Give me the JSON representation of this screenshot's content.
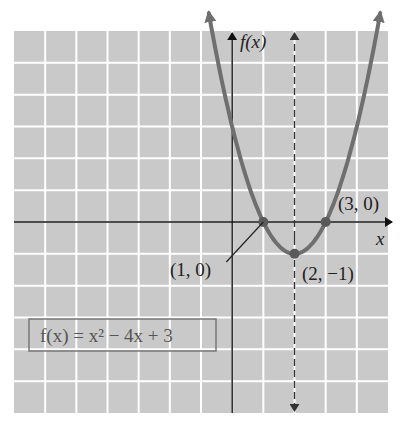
{
  "chart_data": {
    "type": "line",
    "title": "",
    "function_label": "f(x) = x² − 4x + 3",
    "function": {
      "a": 1,
      "b": -4,
      "c": 3
    },
    "xlabel": "x",
    "ylabel": "f(x)",
    "xlim": [
      -7,
      5
    ],
    "ylim": [
      -6,
      6
    ],
    "grid": true,
    "grid_step": 1,
    "axis_of_symmetry": {
      "x": 2,
      "style": "dashed"
    },
    "points": [
      {
        "x": 1,
        "y": 0,
        "label": "(1, 0)"
      },
      {
        "x": 3,
        "y": 0,
        "label": "(3, 0)"
      },
      {
        "x": 2,
        "y": -1,
        "label": "(2, −1)"
      }
    ],
    "curve_range": [
      -0.75,
      4.75
    ],
    "colors": {
      "grid_background": "#c9c9c9",
      "grid_lines": "#ffffff",
      "curve": "#6f6f6f",
      "axes": "#111111"
    }
  },
  "labels": {
    "y_axis": "f(x)",
    "x_axis": "x",
    "point_1": "(1, 0)",
    "point_2": "(3, 0)",
    "point_3": "(2, −1)",
    "equation": "f(x) = x² − 4x + 3"
  }
}
